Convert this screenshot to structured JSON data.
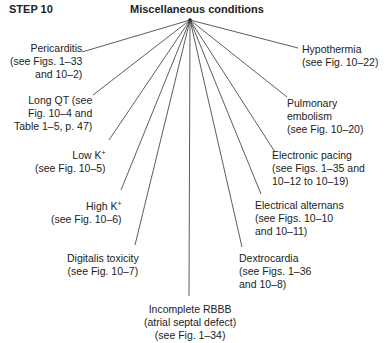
{
  "header": {
    "step": "STEP 10",
    "title": "Miscellaneous conditions"
  },
  "hub": {
    "x": 190,
    "y": 20
  },
  "branches": [
    {
      "id": "pericarditis",
      "lines": [
        "Pericarditis",
        "(see Figs. 1–33",
        "and 10–2)"
      ],
      "end": [
        82,
        52
      ],
      "align": "r",
      "box": [
        8,
        42
      ]
    },
    {
      "id": "long-qt",
      "lines": [
        "Long QT (see",
        "Fig. 10–4 and",
        "Table 1–5, p. 47)"
      ],
      "end": [
        93,
        95
      ],
      "align": "r",
      "box": [
        10,
        94
      ]
    },
    {
      "id": "low-k",
      "lines": [
        "Low K+",
        "(see Fig. 10–5)"
      ],
      "end": [
        109,
        140
      ],
      "align": "r",
      "box": [
        20,
        146
      ]
    },
    {
      "id": "high-k",
      "lines": [
        "High K+",
        "(see Fig. 10–6)"
      ],
      "end": [
        121,
        190
      ],
      "align": "r",
      "box": [
        30,
        197
      ]
    },
    {
      "id": "digitalis",
      "lines": [
        "Digitalis toxicity",
        "(see Fig. 10–7)"
      ],
      "end": [
        135,
        245
      ],
      "align": "c",
      "box": [
        62,
        252
      ]
    },
    {
      "id": "incomplete-rbbb",
      "lines": [
        "Incomplete RBBB",
        "(atrial septal defect)",
        "(see Fig. 1–34)"
      ],
      "end": [
        189,
        296
      ],
      "align": "c",
      "box": [
        140,
        303
      ]
    },
    {
      "id": "dextrocardia",
      "lines": [
        "Dextrocardia",
        "(see Figs. 1–36",
        "and 10–8)"
      ],
      "end": [
        242,
        247
      ],
      "align": "l",
      "box": [
        239,
        252
      ]
    },
    {
      "id": "electrical-alternans",
      "lines": [
        "Electrical alternans",
        "(see Figs. 10–10",
        "and 10–11)"
      ],
      "end": [
        261,
        194
      ],
      "align": "l",
      "box": [
        255,
        199
      ]
    },
    {
      "id": "electronic-pacing",
      "lines": [
        "Electronic pacing",
        "(see Figs. 1–35 and",
        "10–12 to 10–19)"
      ],
      "end": [
        275,
        152
      ],
      "align": "l",
      "box": [
        272,
        149
      ]
    },
    {
      "id": "pulmonary-embolism",
      "lines": [
        "Pulmonary",
        "embolism",
        "(see Fig. 10–20)"
      ],
      "end": [
        287,
        97
      ],
      "align": "l",
      "box": [
        287,
        97
      ]
    },
    {
      "id": "hypothermia",
      "lines": [
        "Hypothermia",
        "(see Fig. 10–22)"
      ],
      "end": [
        298,
        48
      ],
      "align": "l",
      "box": [
        302,
        43
      ]
    }
  ],
  "colors": {
    "line": "#333333",
    "text": "#222222"
  }
}
